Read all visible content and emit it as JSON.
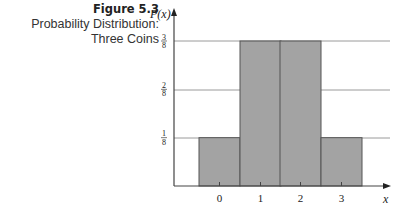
{
  "caption": {
    "figure_label": "Figure 5.3",
    "title_line1": "Probability Distribution:",
    "title_line2": "Three Coins"
  },
  "colors": {
    "bar_fill": "#a3a3a3",
    "bar_stroke": "#555555",
    "grid": "#9a9a9a",
    "axis": "#444444"
  },
  "chart_data": {
    "type": "bar",
    "title": "Probability Distribution: Three Coins",
    "figure": "Figure 5.3",
    "categories": [
      "0",
      "1",
      "2",
      "3"
    ],
    "values": [
      0.125,
      0.375,
      0.375,
      0.125
    ],
    "value_labels": [
      "1/8",
      "3/8",
      "3/8",
      "1/8"
    ],
    "xlabel": "x",
    "ylabel": "P(x)",
    "yticks": [
      {
        "value": 0.125,
        "label": "1/8"
      },
      {
        "value": 0.25,
        "label": "2/8"
      },
      {
        "value": 0.375,
        "label": "3/8"
      }
    ],
    "ylim": [
      0,
      0.45
    ],
    "grid": true,
    "bar_width": "adjacent (histogram style, no gaps)",
    "legend": null
  }
}
